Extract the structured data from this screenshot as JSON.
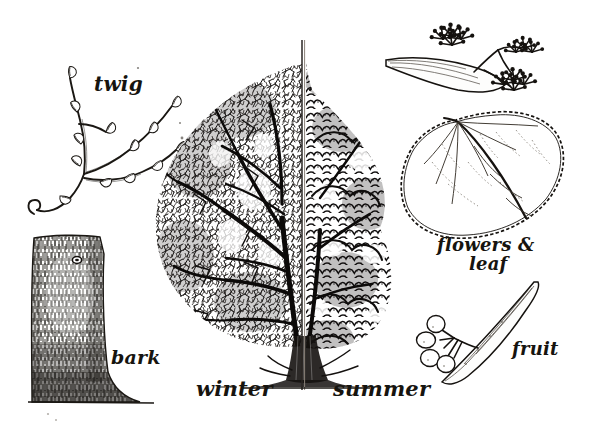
{
  "plate": {
    "title": "Lime / Linden tree identification plate",
    "subject": "Tilia (lime / linden)",
    "medium": "pen-and-ink line engraving",
    "background_color": "#ffffff",
    "ink_color": "#16140f",
    "width": 598,
    "height": 440
  },
  "labels": {
    "twig": "twig",
    "bark": "bark",
    "winter": "winter",
    "summer": "summer",
    "flowers_line1": "flowers &",
    "flowers_line2": "leaf",
    "fruit": "fruit"
  },
  "panels": [
    {
      "name": "twig",
      "label": "twig",
      "position": "top-left",
      "description": "Slender twig with alternate pointed buds and a curled hooked base"
    },
    {
      "name": "bark",
      "label": "bark",
      "position": "bottom-left",
      "description": "Vertically striated trunk section with a small knot, flaring at the ground line"
    },
    {
      "name": "habit",
      "label": "winter / summer",
      "position": "center",
      "description": "Tree silhouette split by a vertical line: bare branching on the left, dense foliage on the right"
    },
    {
      "name": "flowers-leaf",
      "label": "flowers & leaf",
      "position": "top-right",
      "description": "Heart-shaped serrated leaf with asymmetric base, strap-like bract and stippled flower clusters"
    },
    {
      "name": "fruit",
      "label": "fruit",
      "position": "bottom-right",
      "description": "Cluster of round nutlets on a stalk attached to an elongated papery bract"
    }
  ]
}
